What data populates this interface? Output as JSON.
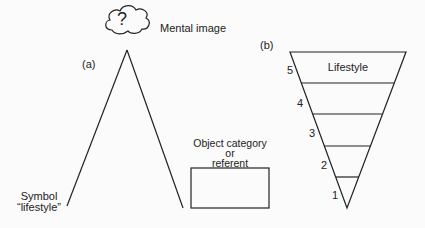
{
  "panel_a": {
    "label": "(a)",
    "cloud_symbol": "?",
    "mental_image": "Mental image",
    "symbol_line1": "Symbol",
    "symbol_line2": "“lifestyle”",
    "object_line1": "Object category",
    "object_line2": "or",
    "object_line3": "referent"
  },
  "panel_b": {
    "label": "(b)",
    "top_label": "Lifestyle",
    "levels": [
      "5",
      "4",
      "3",
      "2",
      "1"
    ]
  },
  "colors": {
    "line": "#222222",
    "background": "#fbfbfb"
  }
}
